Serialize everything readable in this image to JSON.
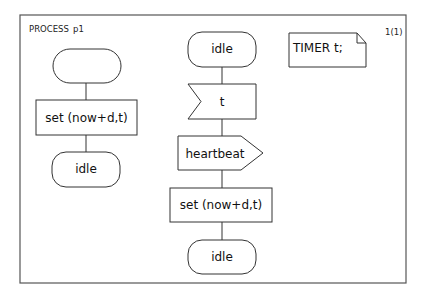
{
  "diagram": {
    "type": "SDL process diagram",
    "header": {
      "kind": "PROCESS",
      "name": "p1",
      "page": "1(1)"
    },
    "declaration": {
      "text": "TIMER t;"
    },
    "left_flow": {
      "start": "",
      "task": "set (now+d,t)",
      "next_state": "idle"
    },
    "center_flow": {
      "state": "idle",
      "input": "t",
      "output": "heartbeat",
      "task": "set (now+d,t)",
      "next_state": "idle"
    }
  }
}
